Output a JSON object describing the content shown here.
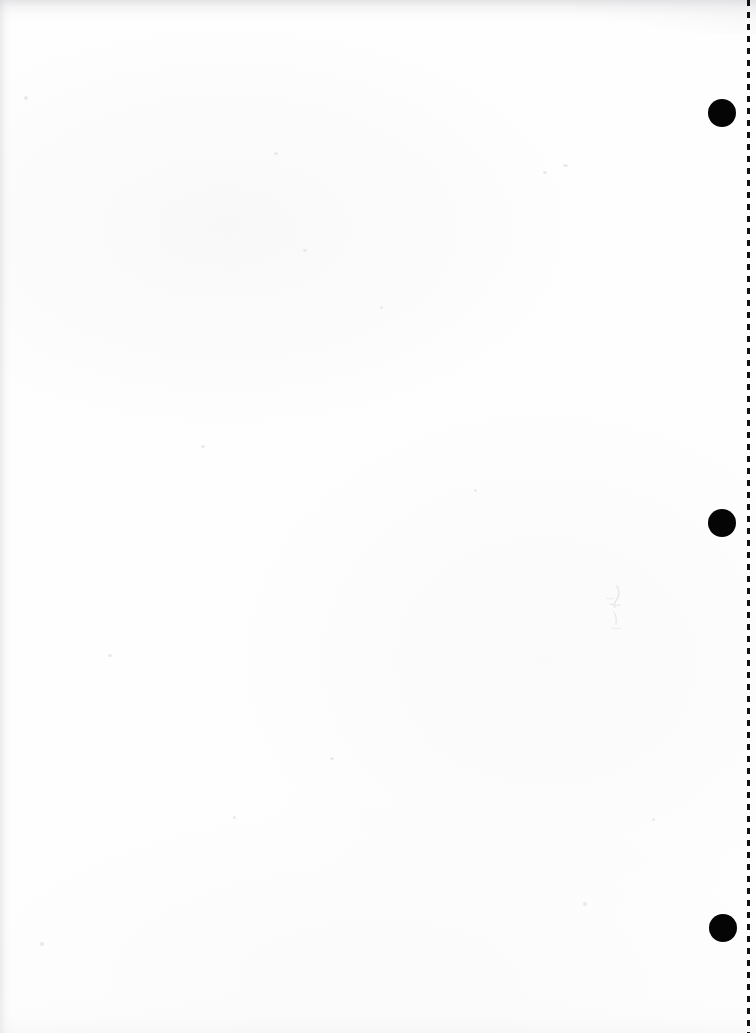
{
  "page": {
    "label": "Scanned blank page",
    "width": 756,
    "height": 1033,
    "background_color": "#fefefe",
    "content_text": "",
    "note": ""
  },
  "margin_rule": {
    "name": "dashed-margin-line",
    "orientation": "vertical",
    "x": 747,
    "width_px": 3,
    "color": "#111111",
    "dash_length_px": 6,
    "gap_length_px": 6,
    "top": 0,
    "bottom": 1033
  },
  "punch_dots": [
    {
      "label": "punch-dot-top",
      "cx": 722,
      "cy": 113,
      "diameter": 28,
      "color": "#050505"
    },
    {
      "label": "punch-dot-middle",
      "cx": 722,
      "cy": 523,
      "diameter": 28,
      "color": "#050505"
    },
    {
      "label": "punch-dot-bottom",
      "cx": 723,
      "cy": 928,
      "diameter": 28,
      "color": "#050505"
    }
  ],
  "artifacts": {
    "top_edge_shadow_color": "#bebec2",
    "left_edge_shadow_color": "#cecED3",
    "smudge": {
      "label": "faint-pencil-smudge",
      "x": 604,
      "y": 584,
      "width": 28,
      "height": 50,
      "color": "#dcdcdf"
    }
  }
}
